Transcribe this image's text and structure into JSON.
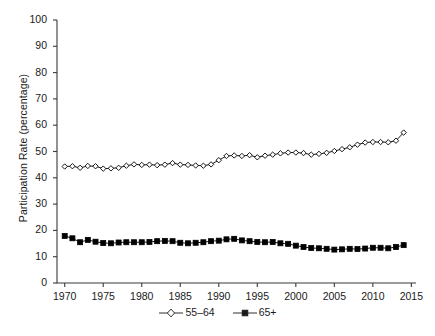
{
  "chart_data": {
    "type": "line",
    "title": "",
    "xlabel": "",
    "ylabel": "Participation Rate (percentage)",
    "xlim": [
      1969,
      2015.6
    ],
    "ylim": [
      0,
      100
    ],
    "grid": false,
    "legend_position": "bottom-center",
    "x_ticks": [
      "1970",
      "1975",
      "1980",
      "1985",
      "1990",
      "1995",
      "2000",
      "2005",
      "2010",
      "2015"
    ],
    "x_tick_values": [
      1970,
      1975,
      1980,
      1985,
      1990,
      1995,
      2000,
      2005,
      2010,
      2015
    ],
    "y_ticks": [
      "0",
      "10",
      "20",
      "30",
      "40",
      "50",
      "60",
      "70",
      "80",
      "90",
      "100"
    ],
    "y_tick_values": [
      0,
      10,
      20,
      30,
      40,
      50,
      60,
      70,
      80,
      90,
      100
    ],
    "x": [
      1970,
      1971,
      1972,
      1973,
      1974,
      1975,
      1976,
      1977,
      1978,
      1979,
      1980,
      1981,
      1982,
      1983,
      1984,
      1985,
      1986,
      1987,
      1988,
      1989,
      1990,
      1991,
      1992,
      1993,
      1994,
      1995,
      1996,
      1997,
      1998,
      1999,
      2000,
      2001,
      2002,
      2003,
      2004,
      2005,
      2006,
      2007,
      2008,
      2009,
      2010,
      2011,
      2012,
      2013,
      2014
    ],
    "series": [
      {
        "name": "55–64",
        "marker": "open-diamond",
        "color": "#000000",
        "values": [
          44.3,
          44.4,
          43.8,
          44.5,
          44.4,
          43.5,
          43.6,
          43.8,
          44.6,
          45.1,
          44.9,
          45.0,
          44.8,
          45.0,
          45.6,
          45.0,
          44.9,
          44.7,
          44.6,
          45.1,
          46.7,
          48.3,
          48.5,
          48.3,
          48.6,
          47.8,
          48.4,
          48.8,
          49.3,
          49.6,
          49.6,
          49.4,
          48.8,
          49.1,
          49.5,
          50.2,
          50.9,
          51.6,
          52.6,
          53.4,
          53.6,
          53.6,
          53.5,
          54.1,
          57.2
        ]
      },
      {
        "name": "65+",
        "marker": "filled-square",
        "color": "#000000",
        "values": [
          17.9,
          17.0,
          15.5,
          16.4,
          15.7,
          15.2,
          15.1,
          15.4,
          15.5,
          15.5,
          15.5,
          15.6,
          15.9,
          16.0,
          15.9,
          15.3,
          15.1,
          15.3,
          15.5,
          15.9,
          16.1,
          16.6,
          16.8,
          16.2,
          15.9,
          15.6,
          15.5,
          15.6,
          15.1,
          14.9,
          14.2,
          13.7,
          13.3,
          13.2,
          13.0,
          12.7,
          12.8,
          13.0,
          12.9,
          13.1,
          13.4,
          13.4,
          13.2,
          13.7,
          14.4
        ]
      }
    ]
  },
  "legend": [
    {
      "label": "55–64",
      "marker": "open-diamond"
    },
    {
      "label": "65+",
      "marker": "filled-square"
    }
  ]
}
